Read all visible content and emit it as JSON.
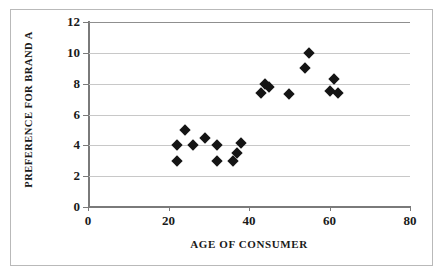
{
  "chart_data": {
    "type": "scatter",
    "title": "",
    "xlabel": "AGE OF CONSUMER",
    "ylabel": "PREFERENCE FOR BRAND A",
    "xlim": [
      0,
      80
    ],
    "ylim": [
      0,
      12
    ],
    "xticks": [
      0,
      20,
      40,
      60,
      80
    ],
    "yticks": [
      0,
      2,
      4,
      6,
      8,
      10,
      12
    ],
    "xtick_labels": [
      "0",
      "20",
      "40",
      "60",
      "80"
    ],
    "ytick_labels": [
      "0",
      "2",
      "4",
      "6",
      "8",
      "10",
      "12"
    ],
    "grid": "horizontal",
    "legend": "none",
    "marker": "filled-diamond",
    "marker_color": "#141414",
    "gridline_color": "#c8c8c8",
    "axis_color": "#7a7a7a",
    "points": [
      {
        "x": 22,
        "y": 4.0
      },
      {
        "x": 22,
        "y": 3.0
      },
      {
        "x": 24,
        "y": 5.0
      },
      {
        "x": 26,
        "y": 4.0
      },
      {
        "x": 29,
        "y": 4.5
      },
      {
        "x": 32,
        "y": 4.0
      },
      {
        "x": 32,
        "y": 3.0
      },
      {
        "x": 36,
        "y": 3.0
      },
      {
        "x": 37,
        "y": 3.5
      },
      {
        "x": 38,
        "y": 4.15
      },
      {
        "x": 43,
        "y": 7.4
      },
      {
        "x": 44,
        "y": 8.0
      },
      {
        "x": 45,
        "y": 7.8
      },
      {
        "x": 50,
        "y": 7.3
      },
      {
        "x": 54,
        "y": 9.0
      },
      {
        "x": 55,
        "y": 10.0
      },
      {
        "x": 60,
        "y": 7.5
      },
      {
        "x": 61,
        "y": 8.3
      },
      {
        "x": 62,
        "y": 7.4
      }
    ]
  }
}
